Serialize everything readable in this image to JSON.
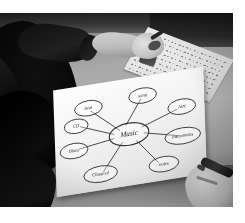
{
  "photo": {
    "description": "Black-and-white classroom photograph: a student seen from behind leans over a desk while hands draw a mind map on a sheet of paper.",
    "treatment": "grayscale",
    "background_color": "#ffffff",
    "subjects": [
      "student-with-dark-hair",
      "reaching-arm-in-dark-sleeve",
      "second-hand-holding-pen",
      "lined-worksheet",
      "mind-map-sheet",
      "desk-surface"
    ]
  },
  "mindmap": {
    "center": {
      "label": "Music"
    },
    "nodes": [
      {
        "label": "beat",
        "position": "top-left"
      },
      {
        "label": "song",
        "position": "top-right"
      },
      {
        "label": "CD",
        "position": "left-upper"
      },
      {
        "label": "Blues",
        "position": "left-lower"
      },
      {
        "label": "Jazz",
        "position": "right-upper"
      },
      {
        "label": "instruments",
        "position": "right-lower"
      },
      {
        "label": "notes",
        "position": "bottom-right"
      },
      {
        "label": "Classical",
        "position": "bottom-left"
      }
    ],
    "spoke_count": 8,
    "ink_color": "#3a3836",
    "paper_color": "#f7f5f1"
  },
  "worksheet": {
    "description": "lined sheet of handwritten text at upper right",
    "line_count": 9
  }
}
